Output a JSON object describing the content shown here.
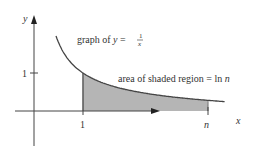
{
  "diagram": {
    "axis_labels": {
      "x": "x",
      "y": "y"
    },
    "ticks": {
      "x_one": "1",
      "x_n": "n",
      "y_one": "1"
    },
    "curve_label_prefix": "graph of ",
    "curve_label_var": "y",
    "curve_label_eq": " = ",
    "curve_fraction": {
      "numerator": "1",
      "denominator": "x"
    },
    "region_label_prefix": "area of shaded region = ln ",
    "region_label_var": "n",
    "function": "1/x",
    "shaded_interval": [
      1,
      3.55
    ],
    "curve_domain": [
      0.45,
      3.9
    ],
    "colors": {
      "shade": "#b5b5b5",
      "line": "#444444",
      "text": "#333333"
    }
  }
}
